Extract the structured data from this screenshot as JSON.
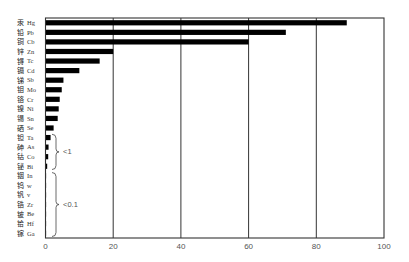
{
  "chart_data": {
    "type": "bar",
    "orientation": "horizontal",
    "title": "",
    "xlabel": "",
    "ylabel": "",
    "xlim": [
      0,
      100
    ],
    "xticks": [
      0,
      20,
      40,
      60,
      80,
      100
    ],
    "grid": "vertical lines at 20, 40, 60, 80",
    "legend": null,
    "categories": [
      {
        "cn": "汞",
        "symbol": "Hg"
      },
      {
        "cn": "铅",
        "symbol": "Pb"
      },
      {
        "cn": "铜",
        "symbol": "Cb"
      },
      {
        "cn": "锌",
        "symbol": "Zn"
      },
      {
        "cn": "锝",
        "symbol": "Tc"
      },
      {
        "cn": "镉",
        "symbol": "Cd"
      },
      {
        "cn": "锑",
        "symbol": "Sb"
      },
      {
        "cn": "钼",
        "symbol": "Mo"
      },
      {
        "cn": "铬",
        "symbol": "Cr"
      },
      {
        "cn": "镍",
        "symbol": "Ni"
      },
      {
        "cn": "锡",
        "symbol": "Sn"
      },
      {
        "cn": "硒",
        "symbol": "Se"
      },
      {
        "cn": "钽",
        "symbol": "Ta"
      },
      {
        "cn": "砷",
        "symbol": "As"
      },
      {
        "cn": "钴",
        "symbol": "Co"
      },
      {
        "cn": "铋",
        "symbol": "Bi"
      },
      {
        "cn": "铟",
        "symbol": "In"
      },
      {
        "cn": "钨",
        "symbol": "w"
      },
      {
        "cn": "钒",
        "symbol": "v"
      },
      {
        "cn": "锆",
        "symbol": "Zr"
      },
      {
        "cn": "铍",
        "symbol": "Be"
      },
      {
        "cn": "铪",
        "symbol": "Hf"
      },
      {
        "cn": "镓",
        "symbol": "Ga"
      }
    ],
    "values": [
      89,
      71,
      60,
      20,
      16,
      10,
      5.3,
      4.8,
      4.2,
      3.9,
      3.6,
      2.4,
      1.5,
      0.9,
      0.8,
      0.5,
      0.05,
      0.05,
      0.05,
      0.05,
      0.05,
      0.05,
      0.05
    ],
    "annotations": [
      {
        "text": "<1",
        "range": [
          "Ta",
          "Bi"
        ],
        "type": "brace"
      },
      {
        "text": "<0.1",
        "range": [
          "In",
          "Ga"
        ],
        "type": "brace"
      }
    ],
    "colors": {
      "bar": "#000000",
      "axis": "#333333",
      "grid": "#333333",
      "tick_text": "#555555"
    }
  }
}
